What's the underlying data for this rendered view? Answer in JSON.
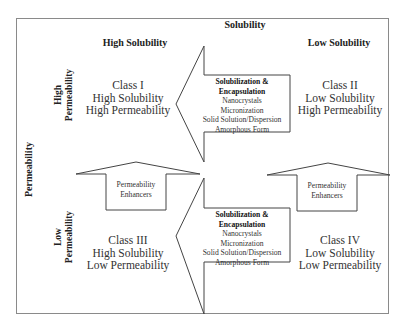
{
  "diagram": {
    "top_axis_label": "Solubility",
    "left_axis_label": "Permeability",
    "column_headers": [
      "High Solubility",
      "Low Solubility"
    ],
    "row_headers": [
      {
        "line1": "High",
        "line2": "Permeability"
      },
      {
        "line1": "Low",
        "line2": "Permeability"
      }
    ],
    "classes": [
      {
        "name": "Class I",
        "solubility": "High Solubility",
        "permeability": "High Permeability"
      },
      {
        "name": "Class II",
        "solubility": "Low Solubility",
        "permeability": "High Permeability"
      },
      {
        "name": "Class III",
        "solubility": "High Solubility",
        "permeability": "Low Permeability"
      },
      {
        "name": "Class IV",
        "solubility": "Low Solubility",
        "permeability": "Low Permeability"
      }
    ],
    "solubility_arrows": [
      {
        "title1": "Solubilization &",
        "title2": "Encapsulation",
        "items": [
          "Nanocrystals",
          "Micronization",
          "Solid Solution/Dispersion",
          "Amorphous Form"
        ]
      },
      {
        "title1": "Solubilization &",
        "title2": "Encapsulation",
        "items": [
          "Nanocrystals",
          "Micronization",
          "Solid Solution/Dispersion",
          "Amorphous Form"
        ]
      }
    ],
    "permeability_arrows": [
      {
        "line1": "Permeability",
        "line2": "Enhancers"
      },
      {
        "line1": "Permeability",
        "line2": "Enhancers"
      }
    ],
    "colors": {
      "stroke": "#444444",
      "border": "#8a8a8a",
      "text": "#222222",
      "background": "#ffffff"
    }
  }
}
